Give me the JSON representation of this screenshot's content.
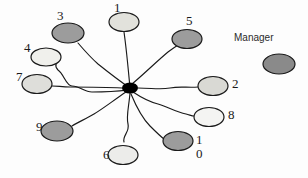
{
  "diagram": {
    "background_color": "#fdfdfd",
    "edge_color": "#1a1a1a",
    "node_stroke_color": "#1a1a1a",
    "palette": {
      "dark_fill": "#8a8a8a",
      "light_fill": "#dcdcdc",
      "white_fill": "#f4f4f4",
      "hub_fill": "#000000"
    },
    "hub": {
      "name": "center-hub-node",
      "cx": 130,
      "cy": 88,
      "rx": 8,
      "ry": 5.5,
      "fill": "#000000"
    },
    "nodes": [
      {
        "id": "1",
        "label": "1",
        "cx": 124,
        "cy": 22,
        "rx": 15,
        "ry": 9.5,
        "fill": "#e2e2dc",
        "label_x": 114,
        "label_y": 1,
        "label_align": "left"
      },
      {
        "id": "2",
        "label": "2",
        "cx": 213,
        "cy": 86,
        "rx": 15,
        "ry": 9.5,
        "fill": "#d9d9d4",
        "label_x": 232,
        "label_y": 77,
        "label_align": "left"
      },
      {
        "id": "3",
        "label": "3",
        "cx": 68,
        "cy": 33,
        "rx": 16,
        "ry": 10,
        "fill": "#9c9c9c",
        "label_x": 57,
        "label_y": 9,
        "label_align": "left"
      },
      {
        "id": "4",
        "label": "4",
        "cx": 46,
        "cy": 57,
        "rx": 15,
        "ry": 9,
        "fill": "#f0f0ec",
        "label_x": 24,
        "label_y": 41,
        "label_align": "left"
      },
      {
        "id": "5",
        "label": "5",
        "cx": 187,
        "cy": 39,
        "rx": 15,
        "ry": 9.5,
        "fill": "#9c9c9c",
        "label_x": 186,
        "label_y": 14,
        "label_align": "left"
      },
      {
        "id": "6",
        "label": "6",
        "cx": 123,
        "cy": 155,
        "rx": 15,
        "ry": 9.5,
        "fill": "#ececea",
        "label_x": 103,
        "label_y": 148,
        "label_align": "left"
      },
      {
        "id": "7",
        "label": "7",
        "cx": 37,
        "cy": 84,
        "rx": 15,
        "ry": 9.5,
        "fill": "#dededa",
        "label_x": 16,
        "label_y": 70,
        "label_align": "left"
      },
      {
        "id": "8",
        "label": "8",
        "cx": 209,
        "cy": 117,
        "rx": 15,
        "ry": 9.5,
        "fill": "#f4f4f2",
        "label_x": 228,
        "label_y": 108,
        "label_align": "left"
      },
      {
        "id": "9",
        "label": "9",
        "cx": 57,
        "cy": 131,
        "rx": 16,
        "ry": 10,
        "fill": "#9c9c9c",
        "label_x": 36,
        "label_y": 120,
        "label_align": "left"
      },
      {
        "id": "10",
        "label": "1\n0",
        "cx": 178,
        "cy": 141,
        "rx": 15,
        "ry": 9.5,
        "fill": "#9c9c9c",
        "label_x": 196,
        "label_y": 133,
        "label_align": "left"
      }
    ],
    "edges": [
      {
        "from": "hub",
        "to": "1",
        "path": "M 130 88 C 128 66 126 46 124 32"
      },
      {
        "from": "hub",
        "to": "2",
        "path": "M 138 88 C 152 88 160 90 170 88 C 180 86 188 88 198 87"
      },
      {
        "from": "hub",
        "to": "3",
        "path": "M 130 88 C 118 80 108 72 98 64 C 90 57 84 50 78 43"
      },
      {
        "from": "hub",
        "to": "4",
        "path": "M 128 90 C 112 92 100 92 92 92 C 84 92 80 86 72 86 C 66 86 64 74 58 70 C 54 66 56 62 60 60"
      },
      {
        "from": "hub",
        "to": "5",
        "path": "M 132 84 C 144 74 156 62 168 52 C 172 49 175 47 178 45"
      },
      {
        "from": "hub",
        "to": "6",
        "path": "M 130 93 C 129 106 126 116 128 124 C 130 132 122 136 124 142"
      },
      {
        "from": "hub",
        "to": "7",
        "path": "M 122 88 C 104 87 86 87 70 87 C 62 87 58 86 52 86"
      },
      {
        "from": "hub",
        "to": "8",
        "path": "M 133 92 C 142 98 150 102 158 104 C 168 107 176 112 186 114 C 190 115 192 116 194 116"
      },
      {
        "from": "hub",
        "to": "9",
        "path": "M 126 92 C 114 100 104 108 94 114 C 86 119 78 122 72 126"
      },
      {
        "from": "hub",
        "to": "10",
        "path": "M 131 94 C 136 106 142 118 150 126 C 156 132 160 136 164 139"
      }
    ],
    "legend": {
      "title": "Manager",
      "title_x": 234,
      "title_y": 32,
      "swatch": {
        "cx": 279,
        "cy": 64,
        "rx": 16,
        "ry": 10,
        "fill": "#8a8a8a"
      }
    }
  }
}
